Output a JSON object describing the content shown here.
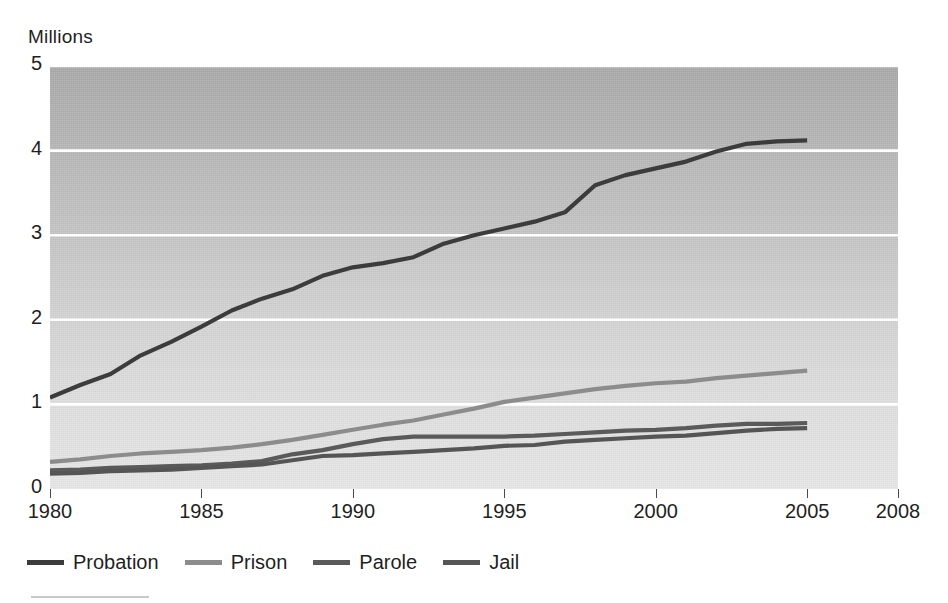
{
  "chart_data": {
    "type": "line",
    "title": "",
    "ylabel": "Millions",
    "xlabel": "",
    "xlim": [
      1980,
      2008
    ],
    "ylim": [
      0,
      5
    ],
    "xticks": [
      1980,
      1985,
      1990,
      1995,
      2000,
      2005,
      2008
    ],
    "yticks": [
      0,
      1,
      2,
      3,
      4,
      5
    ],
    "grid": "horizontal-white",
    "legend_position": "below-axis-left",
    "x": [
      1980,
      1981,
      1982,
      1983,
      1984,
      1985,
      1986,
      1987,
      1988,
      1989,
      1990,
      1991,
      1992,
      1993,
      1994,
      1995,
      1996,
      1997,
      1998,
      1999,
      2000,
      2001,
      2002,
      2003,
      2004,
      2005
    ],
    "series": [
      {
        "name": "Probation",
        "color": "#3c3c3c",
        "values": [
          1.08,
          1.23,
          1.36,
          1.58,
          1.74,
          1.92,
          2.11,
          2.25,
          2.36,
          2.52,
          2.62,
          2.67,
          2.74,
          2.9,
          3.0,
          3.08,
          3.16,
          3.27,
          3.59,
          3.71,
          3.79,
          3.87,
          3.99,
          4.08,
          4.11,
          4.12
        ]
      },
      {
        "name": "Prison",
        "color": "#8c8c8c",
        "values": [
          0.32,
          0.35,
          0.39,
          0.42,
          0.44,
          0.46,
          0.49,
          0.53,
          0.58,
          0.64,
          0.7,
          0.76,
          0.81,
          0.88,
          0.95,
          1.03,
          1.08,
          1.13,
          1.18,
          1.22,
          1.25,
          1.27,
          1.31,
          1.34,
          1.37,
          1.4
        ]
      },
      {
        "name": "Parole",
        "color": "#5a5a5a",
        "values": [
          0.22,
          0.23,
          0.25,
          0.26,
          0.27,
          0.28,
          0.3,
          0.33,
          0.41,
          0.46,
          0.53,
          0.59,
          0.62,
          0.62,
          0.62,
          0.62,
          0.63,
          0.65,
          0.67,
          0.69,
          0.7,
          0.72,
          0.75,
          0.77,
          0.77,
          0.78
        ]
      },
      {
        "name": "Jail",
        "color": "#555555",
        "values": [
          0.18,
          0.19,
          0.21,
          0.22,
          0.23,
          0.25,
          0.27,
          0.29,
          0.34,
          0.39,
          0.4,
          0.42,
          0.44,
          0.46,
          0.48,
          0.51,
          0.52,
          0.56,
          0.58,
          0.6,
          0.62,
          0.63,
          0.66,
          0.69,
          0.71,
          0.72
        ]
      }
    ]
  },
  "axes": {
    "y_title": "Millions",
    "y_tick_labels": [
      "5",
      "4",
      "3",
      "2",
      "1",
      "0"
    ],
    "x_tick_labels": [
      "1980",
      "1985",
      "1990",
      "1995",
      "2000",
      "2005",
      "2008"
    ]
  },
  "legend": {
    "items": [
      {
        "label": "Probation",
        "color": "#3c3c3c"
      },
      {
        "label": "Prison",
        "color": "#8c8c8c"
      },
      {
        "label": "Parole",
        "color": "#5a5a5a"
      },
      {
        "label": "Jail",
        "color": "#555555"
      }
    ]
  },
  "colors": {
    "plot_bg_top": "#a7a7a7",
    "plot_bg_bottom": "#e6e6e6",
    "gridline": "#ffffff",
    "text": "#1f1f1f",
    "page_bg": "#ffffff"
  }
}
